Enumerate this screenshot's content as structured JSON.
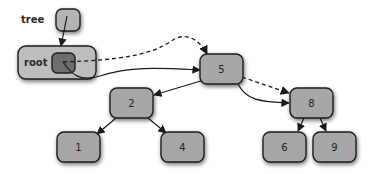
{
  "diagram": {
    "type": "binary-search-tree-rotation",
    "labels": {
      "tree": "tree",
      "root": "root"
    },
    "nodes": [
      {
        "id": "n5",
        "value": "5"
      },
      {
        "id": "n2",
        "value": "2"
      },
      {
        "id": "n8",
        "value": "8"
      },
      {
        "id": "n1",
        "value": "1"
      },
      {
        "id": "n4",
        "value": "4"
      },
      {
        "id": "n6",
        "value": "6"
      },
      {
        "id": "n9",
        "value": "9"
      }
    ],
    "edges": [
      {
        "from": "tree",
        "to": "root",
        "style": "solid"
      },
      {
        "from": "root",
        "to": "n5",
        "style": "dashed"
      },
      {
        "from": "root",
        "to": "n8",
        "style": "solid"
      },
      {
        "from": "n5",
        "to": "n2",
        "style": "solid"
      },
      {
        "from": "n5",
        "to": "n8",
        "style": "dashed"
      },
      {
        "from": "n8",
        "to": "n5",
        "style": "solid"
      },
      {
        "from": "n2",
        "to": "n1",
        "style": "solid"
      },
      {
        "from": "n2",
        "to": "n4",
        "style": "solid"
      },
      {
        "from": "n8",
        "to": "n6",
        "style": "solid"
      },
      {
        "from": "n8",
        "to": "n9",
        "style": "solid"
      }
    ],
    "colors": {
      "node_fill": "#a6a6a6",
      "root_outer_fill": "#bdbdbd",
      "root_inner_fill": "#6e6e6e",
      "stroke": "#1e1e1e"
    }
  }
}
